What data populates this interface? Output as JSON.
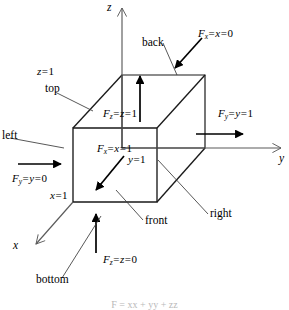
{
  "figure": {
    "type": "geometry-diagram",
    "axes": [
      {
        "name": "z",
        "label": "z",
        "direction": "up"
      },
      {
        "name": "y",
        "label": "y",
        "direction": "right"
      },
      {
        "name": "x",
        "label": "x",
        "direction": "down-left"
      }
    ],
    "faces": [
      {
        "name": "top",
        "label": "top"
      },
      {
        "name": "back",
        "label": "back"
      },
      {
        "name": "left",
        "label": "left"
      },
      {
        "name": "right",
        "label": "right"
      },
      {
        "name": "front",
        "label": "front"
      },
      {
        "name": "bottom",
        "label": "bottom"
      }
    ],
    "coordinate_labels": [
      {
        "name": "z-equals-one",
        "symbol": "z",
        "value": "1",
        "text": "z = 1"
      },
      {
        "name": "x-equals-one",
        "symbol": "x",
        "value": "1",
        "text": "x = 1"
      },
      {
        "name": "y-equals-one",
        "symbol": "y",
        "value": "1",
        "text": "y = 1"
      }
    ],
    "force_labels": [
      {
        "name": "Fx-zero",
        "symbol": "F",
        "subscript": "x",
        "variable": "x",
        "value": "0",
        "text": "F_x = x = 0",
        "face": "back"
      },
      {
        "name": "Fz-one",
        "symbol": "F",
        "subscript": "z",
        "variable": "z",
        "value": "1",
        "text": "F_z = z = 1",
        "face": "top"
      },
      {
        "name": "Fy-one",
        "symbol": "F",
        "subscript": "y",
        "variable": "y",
        "value": "1",
        "text": "F_y = y = 1",
        "face": "right"
      },
      {
        "name": "Fx-one",
        "symbol": "F",
        "subscript": "x",
        "variable": "x",
        "value": "1",
        "text": "F_x = x = 1",
        "face": "front"
      },
      {
        "name": "Fy-zero",
        "symbol": "F",
        "subscript": "y",
        "variable": "y",
        "value": "0",
        "text": "F_y = y = 0",
        "face": "left"
      },
      {
        "name": "Fz-zero",
        "symbol": "F",
        "subscript": "z",
        "variable": "z",
        "value": "0",
        "text": "F_z = z = 0",
        "face": "bottom"
      }
    ],
    "caption": "F = xx + yy + zz",
    "colors": {
      "line": "#000000",
      "background": "#ffffff",
      "caption": "#b9b9b9"
    }
  }
}
